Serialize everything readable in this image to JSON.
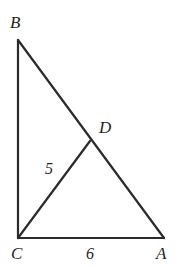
{
  "figure": {
    "kind": "geometry-diagram",
    "width": 180,
    "height": 268,
    "background_color": "#ffffff",
    "stroke_color": "#2b2b2b",
    "stroke_width": 2.2,
    "vertices": [
      {
        "id": "B",
        "label": "B",
        "x": 18,
        "y": 40
      },
      {
        "id": "C",
        "label": "C",
        "x": 18,
        "y": 238
      },
      {
        "id": "A",
        "label": "A",
        "x": 164,
        "y": 238
      },
      {
        "id": "D",
        "label": "D",
        "x": 90,
        "y": 141
      }
    ],
    "segments": [
      {
        "id": "BC",
        "from": "B",
        "to": "C",
        "x1": 18,
        "y1": 40,
        "x2": 18,
        "y2": 238
      },
      {
        "id": "CA",
        "from": "C",
        "to": "A",
        "x1": 18,
        "y1": 238,
        "x2": 164,
        "y2": 238
      },
      {
        "id": "BA",
        "from": "B",
        "to": "A",
        "x1": 18,
        "y1": 40,
        "x2": 164,
        "y2": 238
      },
      {
        "id": "CD",
        "from": "C",
        "to": "D",
        "x1": 18,
        "y1": 238,
        "x2": 90,
        "y2": 141
      }
    ],
    "labels": {
      "vertex_b": "B",
      "vertex_d": "D",
      "vertex_c": "C",
      "vertex_a": "A"
    },
    "measurements": {
      "cd_length": "5",
      "ca_length": "6"
    }
  }
}
